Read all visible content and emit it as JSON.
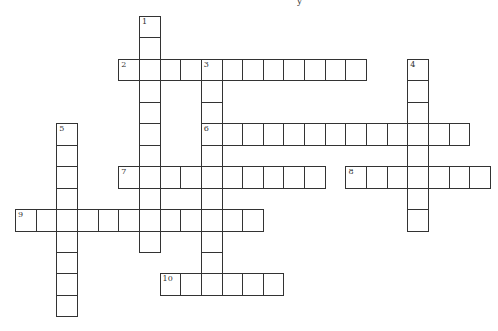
{
  "puzzle": {
    "type": "crossword",
    "title_fragment": "y",
    "cell_pitch_x": 20.65,
    "cell_pitch_y": 21.45,
    "origin_x": 15,
    "origin_y": 16,
    "colors": {
      "line": "#333333",
      "background": "#ffffff",
      "text": "#333333"
    },
    "entries": [
      {
        "number": "1",
        "direction": "down",
        "row": 0,
        "col": 6,
        "length": 11
      },
      {
        "number": "2",
        "direction": "across",
        "row": 2,
        "col": 5,
        "length": 12
      },
      {
        "number": "3",
        "direction": "down",
        "row": 2,
        "col": 9,
        "length": 11
      },
      {
        "number": "4",
        "direction": "down",
        "row": 2,
        "col": 19,
        "length": 8
      },
      {
        "number": "5",
        "direction": "down",
        "row": 5,
        "col": 2,
        "length": 9
      },
      {
        "number": "6",
        "direction": "across",
        "row": 5,
        "col": 9,
        "length": 13
      },
      {
        "number": "7",
        "direction": "across",
        "row": 7,
        "col": 5,
        "length": 10
      },
      {
        "number": "8",
        "direction": "across",
        "row": 7,
        "col": 16,
        "length": 7
      },
      {
        "number": "9",
        "direction": "across",
        "row": 9,
        "col": 0,
        "length": 12
      },
      {
        "number": "10",
        "direction": "across",
        "row": 12,
        "col": 7,
        "length": 6
      }
    ]
  }
}
